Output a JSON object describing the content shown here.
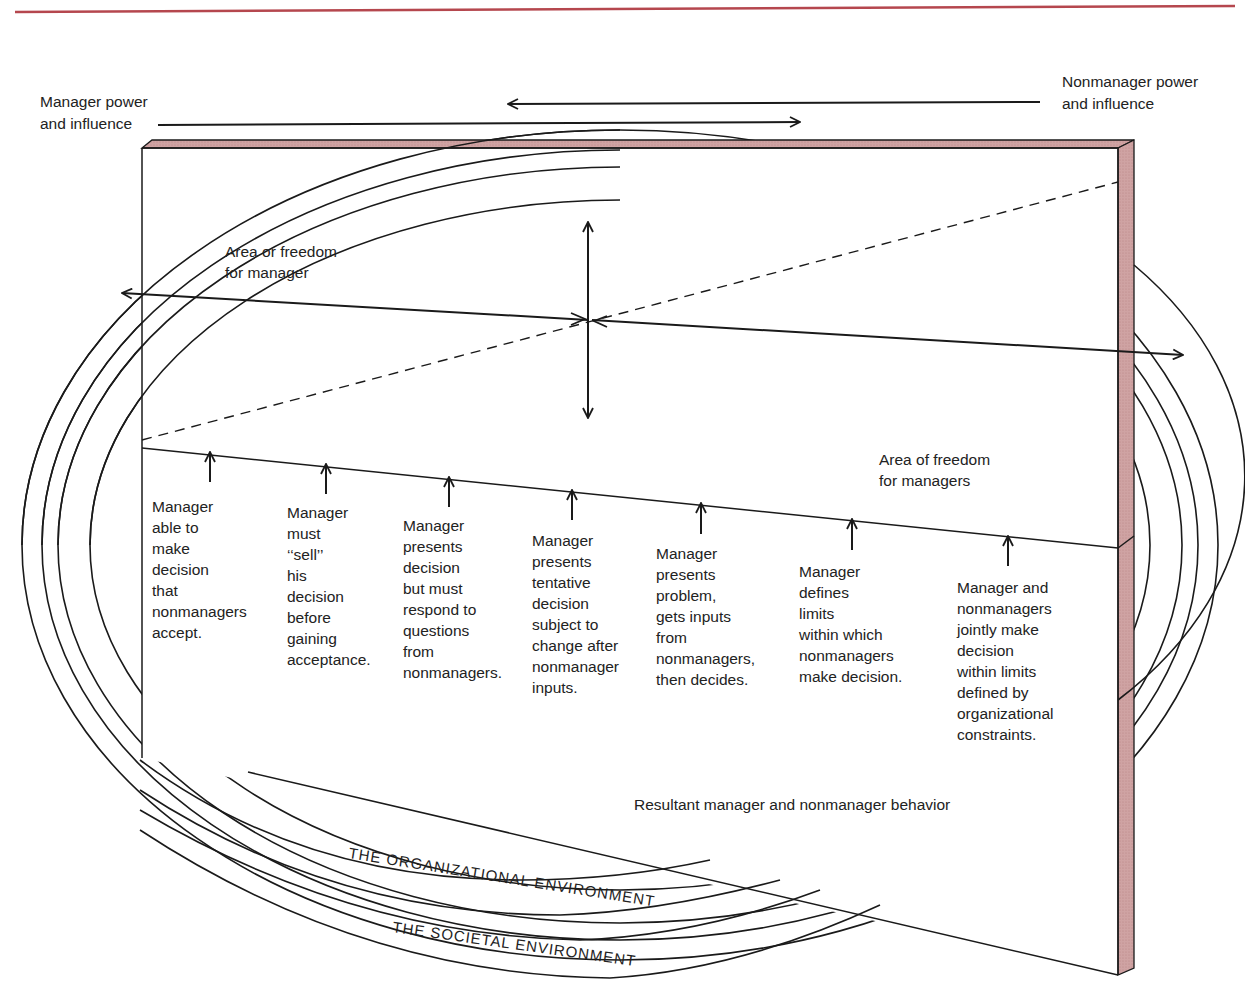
{
  "figure": {
    "header_rule_color": "#b5474e",
    "panel_edge_color": "#c99a9a",
    "labels": {
      "manager_power": [
        "Manager power",
        "and influence"
      ],
      "nonmanager_power": [
        "Nonmanager power",
        "and influence"
      ],
      "area_for_manager": [
        "Area or freedom",
        "for manager"
      ],
      "area_for_managers": [
        "Area of freedom",
        "for managers"
      ],
      "resultant": "Resultant manager and nonmanager behavior",
      "organizational_env": "THE ORGANIZATIONAL ENVIRONMENT",
      "societal_env": "THE SOCIETAL ENVIRONMENT"
    },
    "continuum": [
      {
        "lines": [
          "Manager",
          "able to",
          "make",
          "decision",
          "that",
          "nonmanagers",
          "accept."
        ]
      },
      {
        "lines": [
          "Manager",
          "must",
          "‘‘sell’’",
          "his",
          "decision",
          "before",
          "gaining",
          "acceptance."
        ]
      },
      {
        "lines": [
          "Manager",
          "presents",
          "decision",
          "but must",
          "respond to",
          "questions",
          "from",
          "nonmanagers."
        ]
      },
      {
        "lines": [
          "Manager",
          "presents",
          "tentative",
          "decision",
          "subject to",
          "change after",
          "nonmanager",
          "inputs."
        ]
      },
      {
        "lines": [
          "Manager",
          "presents",
          "problem,",
          "gets inputs",
          "from",
          "nonmanagers,",
          "then decides."
        ]
      },
      {
        "lines": [
          "Manager",
          "defines",
          "limits",
          "within which",
          "nonmanagers",
          "make decision."
        ]
      },
      {
        "lines": [
          "Manager and",
          "nonmanagers",
          "jointly make",
          "decision",
          "within limits",
          "defined by",
          "organizational",
          "constraints."
        ]
      }
    ]
  }
}
